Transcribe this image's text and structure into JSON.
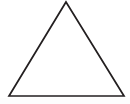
{
  "figure": {
    "title": "triangle",
    "alt_text": "Triangle",
    "background_color": "#ffffff",
    "stroke_color": "#231f20",
    "fill_color": "#ffffff",
    "stroke_width": 1.7,
    "shape_type": "triangle",
    "vertex_count": "3",
    "canvas": {
      "width": 130,
      "height": 104
    },
    "vertices": [
      {
        "label": "apex",
        "x": 66,
        "y": 2
      },
      {
        "label": "bottom-right",
        "x": 124,
        "y": 96
      },
      {
        "label": "bottom-left",
        "x": 9,
        "y": 96
      }
    ],
    "points_attr": "66,2 124,96 9,96"
  }
}
